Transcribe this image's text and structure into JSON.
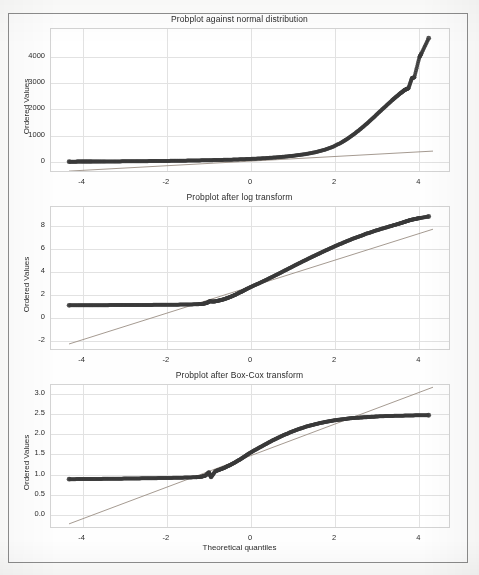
{
  "figure": {
    "background_color": "#fdfdfc",
    "frame_color": "#8d8d8d",
    "marker_color": "#3a3a3a",
    "fit_line_color": "#9b8f85",
    "grid_color": "#e2e2e2",
    "axes_color": "#d4d4d4",
    "shared_xlabel": "Theoretical quantiles"
  },
  "chart_data": [
    {
      "type": "scatter",
      "title": "Probplot against normal distribution",
      "xlabel": "",
      "ylabel": "Ordered Values",
      "xlim": [
        -4.75,
        4.75
      ],
      "ylim": [
        -420,
        5050
      ],
      "xticks": [
        -4,
        -2,
        0,
        2,
        4
      ],
      "xticklabels": [
        "-4",
        "-2",
        "0",
        "2",
        "4"
      ],
      "yticks": [
        0,
        1000,
        2000,
        3000,
        4000
      ],
      "yticklabels": [
        "0",
        "1000",
        "2000",
        "3000",
        "4000"
      ],
      "grid": true,
      "legend": "none",
      "fit_line": {
        "slope": 88.0,
        "intercept": 32.0
      },
      "points": [
        [
          -4.32,
          11
        ],
        [
          -4.15,
          12
        ],
        [
          -4.02,
          13
        ],
        [
          -3.9,
          14
        ],
        [
          -3.78,
          15
        ],
        [
          -3.62,
          16
        ],
        [
          -3.45,
          18
        ],
        [
          -3.25,
          20
        ],
        [
          -3.05,
          22
        ],
        [
          -2.85,
          25
        ],
        [
          -2.65,
          28
        ],
        [
          -2.45,
          31
        ],
        [
          -2.25,
          34
        ],
        [
          -2.05,
          38
        ],
        [
          -1.85,
          42
        ],
        [
          -1.65,
          47
        ],
        [
          -1.45,
          52
        ],
        [
          -1.25,
          58
        ],
        [
          -1.05,
          64
        ],
        [
          -0.85,
          71
        ],
        [
          -0.65,
          79
        ],
        [
          -0.45,
          88
        ],
        [
          -0.25,
          99
        ],
        [
          -0.05,
          112
        ],
        [
          0.15,
          127
        ],
        [
          0.35,
          145
        ],
        [
          0.55,
          167
        ],
        [
          0.75,
          193
        ],
        [
          0.95,
          225
        ],
        [
          1.15,
          264
        ],
        [
          1.35,
          313
        ],
        [
          1.55,
          377
        ],
        [
          1.75,
          462
        ],
        [
          1.95,
          578
        ],
        [
          2.15,
          740
        ],
        [
          2.3,
          890
        ],
        [
          2.45,
          1060
        ],
        [
          2.6,
          1250
        ],
        [
          2.75,
          1455
        ],
        [
          2.9,
          1670
        ],
        [
          3.05,
          1900
        ],
        [
          3.2,
          2120
        ],
        [
          3.35,
          2340
        ],
        [
          3.45,
          2480
        ],
        [
          3.55,
          2610
        ],
        [
          3.62,
          2700
        ],
        [
          3.68,
          2760
        ],
        [
          3.74,
          2800
        ],
        [
          3.82,
          3180
        ],
        [
          3.88,
          3220
        ],
        [
          4.0,
          3980
        ],
        [
          4.05,
          4130
        ],
        [
          4.22,
          4700
        ]
      ]
    },
    {
      "type": "scatter",
      "title": "Probplot after log transform",
      "xlabel": "",
      "ylabel": "Ordered Values",
      "xlim": [
        -4.75,
        4.75
      ],
      "ylim": [
        -2.85,
        9.6
      ],
      "xticks": [
        -4,
        -2,
        0,
        2,
        4
      ],
      "xticklabels": [
        "-4",
        "-2",
        "0",
        "2",
        "4"
      ],
      "yticks": [
        -2,
        0,
        2,
        4,
        6,
        8
      ],
      "yticklabels": [
        "-2",
        "0",
        "2",
        "4",
        "6",
        "8"
      ],
      "grid": true,
      "legend": "none",
      "fit_line": {
        "slope": 1.148,
        "intercept": 2.72
      },
      "points": [
        [
          -4.32,
          1.1
        ],
        [
          -4.1,
          1.1
        ],
        [
          -3.9,
          1.11
        ],
        [
          -3.7,
          1.11
        ],
        [
          -3.5,
          1.11
        ],
        [
          -3.3,
          1.12
        ],
        [
          -3.1,
          1.12
        ],
        [
          -2.9,
          1.12
        ],
        [
          -2.7,
          1.13
        ],
        [
          -2.5,
          1.13
        ],
        [
          -2.3,
          1.14
        ],
        [
          -2.1,
          1.14
        ],
        [
          -1.9,
          1.15
        ],
        [
          -1.7,
          1.16
        ],
        [
          -1.5,
          1.17
        ],
        [
          -1.3,
          1.19
        ],
        [
          -1.15,
          1.22
        ],
        [
          -1.05,
          1.3
        ],
        [
          -0.98,
          1.45
        ],
        [
          -0.88,
          1.42
        ],
        [
          -0.78,
          1.5
        ],
        [
          -0.68,
          1.58
        ],
        [
          -0.58,
          1.7
        ],
        [
          -0.48,
          1.84
        ],
        [
          -0.38,
          2.0
        ],
        [
          -0.28,
          2.18
        ],
        [
          -0.18,
          2.36
        ],
        [
          -0.08,
          2.55
        ],
        [
          0.05,
          2.78
        ],
        [
          0.2,
          3.02
        ],
        [
          0.35,
          3.28
        ],
        [
          0.5,
          3.55
        ],
        [
          0.65,
          3.82
        ],
        [
          0.8,
          4.1
        ],
        [
          0.95,
          4.38
        ],
        [
          1.1,
          4.66
        ],
        [
          1.25,
          4.93
        ],
        [
          1.4,
          5.2
        ],
        [
          1.55,
          5.46
        ],
        [
          1.7,
          5.72
        ],
        [
          1.85,
          5.97
        ],
        [
          2.0,
          6.22
        ],
        [
          2.15,
          6.45
        ],
        [
          2.3,
          6.68
        ],
        [
          2.45,
          6.9
        ],
        [
          2.6,
          7.1
        ],
        [
          2.75,
          7.3
        ],
        [
          2.9,
          7.48
        ],
        [
          3.05,
          7.66
        ],
        [
          3.2,
          7.82
        ],
        [
          3.35,
          7.98
        ],
        [
          3.5,
          8.14
        ],
        [
          3.62,
          8.28
        ],
        [
          3.72,
          8.4
        ],
        [
          3.82,
          8.5
        ],
        [
          3.92,
          8.58
        ],
        [
          4.02,
          8.65
        ],
        [
          4.22,
          8.78
        ]
      ]
    },
    {
      "type": "scatter",
      "title": "Probplot after Box-Cox transform",
      "xlabel": "Theoretical quantiles",
      "ylabel": "Ordered Values",
      "xlim": [
        -4.75,
        4.75
      ],
      "ylim": [
        -0.35,
        3.22
      ],
      "xticks": [
        -4,
        -2,
        0,
        2,
        4
      ],
      "xticklabels": [
        "-4",
        "-2",
        "0",
        "2",
        "4"
      ],
      "yticks": [
        0.0,
        0.5,
        1.0,
        1.5,
        2.0,
        2.5,
        3.0
      ],
      "yticklabels": [
        "0.0",
        "0.5",
        "1.0",
        "1.5",
        "2.0",
        "2.5",
        "3.0"
      ],
      "grid": true,
      "legend": "none",
      "fit_line": {
        "slope": 0.392,
        "intercept": 1.47
      },
      "points": [
        [
          -4.32,
          0.885
        ],
        [
          -4.1,
          0.887
        ],
        [
          -3.9,
          0.889
        ],
        [
          -3.7,
          0.891
        ],
        [
          -3.5,
          0.893
        ],
        [
          -3.3,
          0.896
        ],
        [
          -3.1,
          0.898
        ],
        [
          -2.9,
          0.901
        ],
        [
          -2.7,
          0.904
        ],
        [
          -2.5,
          0.907
        ],
        [
          -2.3,
          0.91
        ],
        [
          -2.1,
          0.913
        ],
        [
          -1.9,
          0.917
        ],
        [
          -1.7,
          0.921
        ],
        [
          -1.5,
          0.926
        ],
        [
          -1.3,
          0.934
        ],
        [
          -1.18,
          0.945
        ],
        [
          -1.08,
          0.975
        ],
        [
          -1.0,
          1.06
        ],
        [
          -0.95,
          0.93
        ],
        [
          -0.85,
          1.08
        ],
        [
          -0.75,
          1.12
        ],
        [
          -0.65,
          1.16
        ],
        [
          -0.55,
          1.21
        ],
        [
          -0.45,
          1.26
        ],
        [
          -0.35,
          1.32
        ],
        [
          -0.25,
          1.38
        ],
        [
          -0.15,
          1.45
        ],
        [
          -0.05,
          1.52
        ],
        [
          0.08,
          1.6
        ],
        [
          0.22,
          1.68
        ],
        [
          0.36,
          1.76
        ],
        [
          0.5,
          1.84
        ],
        [
          0.64,
          1.91
        ],
        [
          0.78,
          1.98
        ],
        [
          0.92,
          2.04
        ],
        [
          1.06,
          2.1
        ],
        [
          1.2,
          2.15
        ],
        [
          1.35,
          2.2
        ],
        [
          1.5,
          2.24
        ],
        [
          1.65,
          2.28
        ],
        [
          1.8,
          2.31
        ],
        [
          1.95,
          2.34
        ],
        [
          2.1,
          2.36
        ],
        [
          2.25,
          2.38
        ],
        [
          2.4,
          2.4
        ],
        [
          2.55,
          2.41
        ],
        [
          2.7,
          2.42
        ],
        [
          2.85,
          2.43
        ],
        [
          3.0,
          2.44
        ],
        [
          3.2,
          2.45
        ],
        [
          3.4,
          2.455
        ],
        [
          3.6,
          2.46
        ],
        [
          3.8,
          2.465
        ],
        [
          4.0,
          2.47
        ],
        [
          4.22,
          2.47
        ]
      ]
    }
  ]
}
